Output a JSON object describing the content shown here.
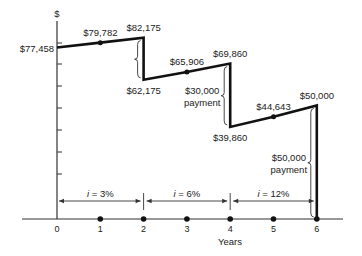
{
  "chart_data": {
    "type": "line",
    "title": "",
    "xlabel": "Years",
    "ylabel": "$",
    "xlim": [
      0,
      6
    ],
    "x_ticks": [
      "0",
      "1",
      "2",
      "3",
      "4",
      "5",
      "6"
    ],
    "grid": false,
    "legend": "none",
    "series": [
      {
        "name": "Account balance",
        "points": [
          {
            "x": 0,
            "y": 77458,
            "label": "$77,458"
          },
          {
            "x": 1,
            "y": 79782,
            "label": "$79,782"
          },
          {
            "x": 2,
            "y": 82175,
            "label": "$82,175"
          },
          {
            "x": 2,
            "y": 62175,
            "label": "$62,175"
          },
          {
            "x": 3,
            "y": 65906,
            "label": "$65,906"
          },
          {
            "x": 4,
            "y": 69860,
            "label": "$69,860"
          },
          {
            "x": 4,
            "y": 39860,
            "label": "$39,860"
          },
          {
            "x": 5,
            "y": 44643,
            "label": "$44,643"
          },
          {
            "x": 6,
            "y": 50000,
            "label": "$50,000"
          },
          {
            "x": 6,
            "y": 0,
            "label": ""
          }
        ]
      }
    ],
    "payments": [
      {
        "x": 2,
        "from": 82175,
        "to": 62175,
        "label_lines": []
      },
      {
        "x": 4,
        "from": 69860,
        "to": 39860,
        "label_lines": [
          "$30,000",
          "payment"
        ]
      },
      {
        "x": 6,
        "from": 50000,
        "to": 0,
        "label_lines": [
          "$50,000",
          "payment"
        ]
      }
    ],
    "interest_periods": [
      {
        "from": 0,
        "to": 2,
        "label": "i = 3%"
      },
      {
        "from": 2,
        "to": 4,
        "label": "i = 6%"
      },
      {
        "from": 4,
        "to": 6,
        "label": "i = 12%"
      }
    ],
    "axis_dots": [
      1,
      2,
      3,
      4,
      5,
      6
    ]
  }
}
